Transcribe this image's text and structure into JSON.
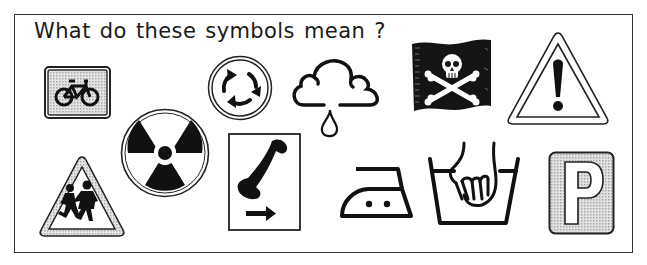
{
  "worksheet": {
    "title": "What do these symbols mean ?",
    "colors": {
      "ink": "#111111",
      "shade": "#cfcfcf",
      "paper": "#ffffff",
      "frame": "#333333"
    }
  },
  "symbols": [
    {
      "id": "cycle-route",
      "description": "Cycle route sign (bicycle on grey rectangle)"
    },
    {
      "id": "roundabout",
      "description": "Mini roundabout sign (three circular arrows)"
    },
    {
      "id": "rain-cloud",
      "description": "Weather symbol: cloud with raindrop"
    },
    {
      "id": "skull-crossbones-flag",
      "description": "Black flag with skull and crossbones"
    },
    {
      "id": "warning-exclamation",
      "description": "Warning triangle with exclamation mark"
    },
    {
      "id": "children-crossing",
      "description": "Triangle sign with two running children"
    },
    {
      "id": "radiation",
      "description": "Radiation hazard trefoil"
    },
    {
      "id": "telephone-direction",
      "description": "Telephone sign with arrow pointing right"
    },
    {
      "id": "iron-medium",
      "description": "Laundry symbol: iron with two dots"
    },
    {
      "id": "hand-wash",
      "description": "Laundry symbol: hand in wash tub"
    },
    {
      "id": "parking",
      "description": "Parking sign letter P"
    }
  ]
}
